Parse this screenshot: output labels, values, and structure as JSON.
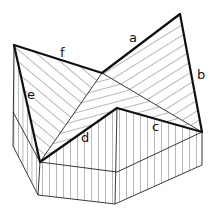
{
  "diagram": {
    "type": "roof-valley-isometric",
    "labels": {
      "a": "a",
      "b": "b",
      "c": "c",
      "d": "d",
      "e": "e",
      "f": "f"
    },
    "colors": {
      "line": "#111111",
      "background": "#ffffff"
    }
  }
}
